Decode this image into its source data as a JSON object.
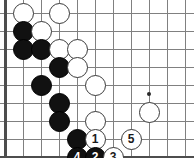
{
  "board": {
    "title": "go-board-diagram",
    "origin_x": 5,
    "origin_y": 13,
    "spacing": 18,
    "cols": 11,
    "rows": 8,
    "edges": {
      "left": true,
      "bottom": true,
      "top": false,
      "right": false
    },
    "line_color": "#808080",
    "edge_color": "#4d4d4d",
    "background": "#ffffff",
    "stone_black_color": "#111111",
    "stone_white_color": "#ffffff",
    "stone_outline_color": "#3a3a3a",
    "stone_radius": 10.5,
    "hoshi": [
      {
        "col": 8,
        "row": 4.5
      }
    ],
    "stones": [
      {
        "col": 1,
        "row": 0,
        "color": "white",
        "label": ""
      },
      {
        "col": 3,
        "row": 0,
        "color": "white",
        "label": ""
      },
      {
        "col": 1,
        "row": 1,
        "color": "black",
        "label": ""
      },
      {
        "col": 2,
        "row": 1,
        "color": "white",
        "label": ""
      },
      {
        "col": 1,
        "row": 2,
        "color": "black",
        "label": ""
      },
      {
        "col": 2,
        "row": 2,
        "color": "black",
        "label": ""
      },
      {
        "col": 3,
        "row": 2,
        "color": "white",
        "label": ""
      },
      {
        "col": 4,
        "row": 2,
        "color": "white",
        "label": ""
      },
      {
        "col": 3,
        "row": 3,
        "color": "black",
        "label": ""
      },
      {
        "col": 4,
        "row": 3,
        "color": "white",
        "label": ""
      },
      {
        "col": 2,
        "row": 4,
        "color": "black",
        "label": ""
      },
      {
        "col": 5,
        "row": 4,
        "color": "white",
        "label": ""
      },
      {
        "col": 3,
        "row": 5,
        "color": "black",
        "label": ""
      },
      {
        "col": 3,
        "row": 6,
        "color": "black",
        "label": ""
      },
      {
        "col": 5,
        "row": 6,
        "color": "white",
        "label": ""
      },
      {
        "col": 8,
        "row": 5.5,
        "color": "white",
        "label": ""
      },
      {
        "col": 4,
        "row": 7,
        "color": "black",
        "label": ""
      },
      {
        "col": 5,
        "row": 7,
        "color": "white",
        "label": "1"
      },
      {
        "col": 7,
        "row": 7,
        "color": "white",
        "label": "5"
      },
      {
        "col": 4,
        "row": 8,
        "color": "black",
        "label": "4"
      },
      {
        "col": 5,
        "row": 8,
        "color": "black",
        "label": "2"
      },
      {
        "col": 6,
        "row": 8,
        "color": "white",
        "label": "3"
      }
    ],
    "move_sequence": [
      {
        "number": "1",
        "color": "white"
      },
      {
        "number": "2",
        "color": "black"
      },
      {
        "number": "3",
        "color": "white"
      },
      {
        "number": "4",
        "color": "black"
      },
      {
        "number": "5",
        "color": "white"
      }
    ]
  }
}
